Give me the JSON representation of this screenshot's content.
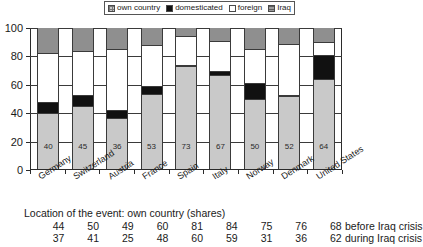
{
  "chart_data": {
    "type": "bar",
    "title": "",
    "subtype": "stacked-bar-100",
    "xlabel": "",
    "ylabel": "",
    "ylim": [
      0,
      100
    ],
    "yticks": [
      0,
      20,
      40,
      60,
      80,
      100
    ],
    "grid": true,
    "legend_position": "top",
    "categories": [
      "Germany",
      "Switzerland",
      "Austria",
      "France",
      "Spain",
      "Italy",
      "Norway",
      "Denmark",
      "United States"
    ],
    "series": [
      {
        "name": "own country",
        "color": "#c9c9c9",
        "values": [
          40,
          45,
          36,
          53,
          73,
          67,
          50,
          52,
          64
        ]
      },
      {
        "name": "domesticated",
        "color": "#111111",
        "values": [
          7,
          7,
          5,
          5,
          0,
          2,
          10,
          0,
          16
        ]
      },
      {
        "name": "foreign",
        "color": "#ffffff",
        "values": [
          35,
          32,
          44,
          30,
          21,
          22,
          25,
          37,
          10
        ]
      },
      {
        "name": "Iraq",
        "color": "#8f8f8f",
        "values": [
          18,
          16,
          15,
          12,
          6,
          9,
          15,
          11,
          10
        ]
      }
    ],
    "bar_labels": [
      40,
      45,
      36,
      53,
      73,
      67,
      50,
      52,
      64
    ]
  },
  "legend": {
    "items": [
      {
        "label": "own country",
        "icon": "swatch-own-country"
      },
      {
        "label": "domesticated",
        "icon": "swatch-domesticated"
      },
      {
        "label": "foreign",
        "icon": "swatch-foreign"
      },
      {
        "label": "Iraq",
        "icon": "swatch-iraq"
      }
    ]
  },
  "axis": {
    "y_tick_labels": [
      "100",
      "80",
      "60",
      "40",
      "20",
      "0"
    ]
  },
  "table": {
    "caption": "Location of the event: own country (shares)",
    "rows": [
      {
        "label": "before Iraq crisis",
        "values": [
          "44",
          "50",
          "49",
          "60",
          "81",
          "84",
          "75",
          "76",
          "68"
        ]
      },
      {
        "label": "during Iraq crisis",
        "values": [
          "37",
          "41",
          "25",
          "48",
          "60",
          "59",
          "31",
          "36",
          "62"
        ]
      }
    ]
  }
}
